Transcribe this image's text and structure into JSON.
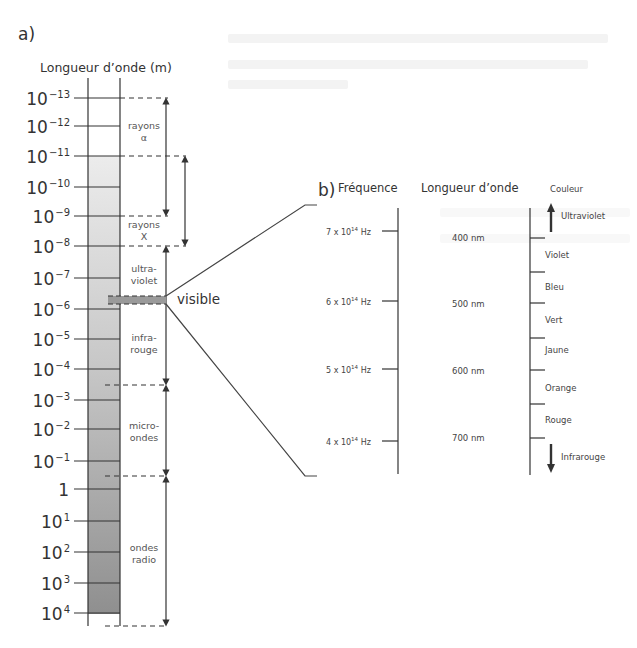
{
  "panel_a": {
    "label": "a)",
    "axis_title": "Longueur d’onde (m)",
    "ticks": [
      {
        "base": "10",
        "exp": "−13"
      },
      {
        "base": "10",
        "exp": "−12"
      },
      {
        "base": "10",
        "exp": "−11"
      },
      {
        "base": "10",
        "exp": "−10"
      },
      {
        "base": "10",
        "exp": "−9"
      },
      {
        "base": "10",
        "exp": "−8"
      },
      {
        "base": "10",
        "exp": "−7"
      },
      {
        "base": "10",
        "exp": "−6"
      },
      {
        "base": "10",
        "exp": "−5"
      },
      {
        "base": "10",
        "exp": "−4"
      },
      {
        "base": "10",
        "exp": "−3"
      },
      {
        "base": "10",
        "exp": "−2"
      },
      {
        "base": "10",
        "exp": "−1"
      },
      {
        "base": "1",
        "exp": ""
      },
      {
        "base": "10",
        "exp": "1"
      },
      {
        "base": "10",
        "exp": "2"
      },
      {
        "base": "10",
        "exp": "3"
      },
      {
        "base": "10",
        "exp": "4"
      }
    ],
    "bands": [
      {
        "line1": "rayons",
        "line2": "α"
      },
      {
        "line1": "rayons",
        "line2": "X"
      },
      {
        "line1": "ultra-",
        "line2": "violet"
      },
      {
        "line1": "infra-",
        "line2": "rouge"
      },
      {
        "line1": "micro-",
        "line2": "ondes"
      },
      {
        "line1": "ondes",
        "line2": "radio"
      }
    ],
    "visible_label": "visible"
  },
  "panel_b": {
    "label": "b)",
    "frequency_header": "Fréquence",
    "wavelength_header": "Longueur d’onde",
    "color_header": "Couleur",
    "frequencies": [
      {
        "mant": "7",
        "exp": "14",
        "unit": "Hz"
      },
      {
        "mant": "6",
        "exp": "14",
        "unit": "Hz"
      },
      {
        "mant": "5",
        "exp": "14",
        "unit": "Hz"
      },
      {
        "mant": "4",
        "exp": "14",
        "unit": "Hz"
      }
    ],
    "wavelengths": [
      "400 nm",
      "500 nm",
      "600 nm",
      "700 nm"
    ],
    "colors": [
      "Ultraviolet",
      "Violet",
      "Bleu",
      "Vert",
      "Jaune",
      "Orange",
      "Rouge",
      "Infrarouge"
    ]
  }
}
